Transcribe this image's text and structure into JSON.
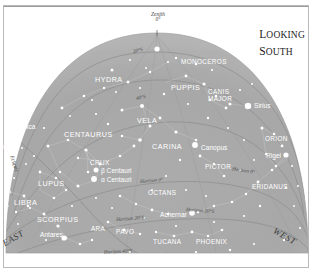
{
  "title": {
    "line1_cap": "L",
    "line1_rest": "OOKING",
    "line2_cap": "S",
    "line2_rest": "OUTH"
  },
  "zenith": {
    "label": "Zenith",
    "value": "0°"
  },
  "cardinals": {
    "east": "EAST",
    "west": "WEST"
  },
  "declination_arcs": [
    {
      "name": "dec-20s",
      "label": "20°S"
    },
    {
      "name": "dec-40s",
      "label": "40°S"
    }
  ],
  "horizon_lines": [
    {
      "name": "horizon-0",
      "label": "Horizon 0°"
    },
    {
      "name": "horizon-20s",
      "label": "Horizon 20°S"
    },
    {
      "name": "horizon-40s",
      "label": "Horizon 40°S"
    }
  ],
  "ecliptic": {
    "label": "Ecliptic"
  },
  "constellations": [
    {
      "name": "hydra",
      "label": "HYDRA",
      "x": 95,
      "y": 76,
      "size": "big"
    },
    {
      "name": "monoceros",
      "label": "MONOCEROS",
      "x": 181,
      "y": 59,
      "size": "con"
    },
    {
      "name": "puppis",
      "label": "PUPPIS",
      "x": 171,
      "y": 84,
      "size": "big"
    },
    {
      "name": "canis-major",
      "label": "CANIS",
      "x": 208,
      "y": 89,
      "size": "con"
    },
    {
      "name": "canis-major2",
      "label": "MAJOR",
      "x": 208,
      "y": 96,
      "size": "con"
    },
    {
      "name": "vela",
      "label": "VELA",
      "x": 137,
      "y": 117,
      "size": "big"
    },
    {
      "name": "centaurus",
      "label": "CENTAURUS",
      "x": 64,
      "y": 131,
      "size": "big"
    },
    {
      "name": "virgo",
      "label": "VIRGO",
      "x": -5,
      "y": 145,
      "size": "con"
    },
    {
      "name": "carina",
      "label": "CARINA",
      "x": 152,
      "y": 143,
      "size": "big"
    },
    {
      "name": "pictor",
      "label": "PICTOR",
      "x": 205,
      "y": 164,
      "size": "con"
    },
    {
      "name": "orion",
      "label": "ORION",
      "x": 265,
      "y": 136,
      "size": "con"
    },
    {
      "name": "eridanus",
      "label": "ERIDANUS",
      "x": 252,
      "y": 184,
      "size": "con"
    },
    {
      "name": "crux",
      "label": "CRUX",
      "x": 90,
      "y": 160,
      "size": "con"
    },
    {
      "name": "lupus",
      "label": "LUPUS",
      "x": 38,
      "y": 180,
      "size": "big"
    },
    {
      "name": "libra",
      "label": "LIBRA",
      "x": 14,
      "y": 199,
      "size": "big"
    },
    {
      "name": "octans",
      "label": "OCTANS",
      "x": 148,
      "y": 190,
      "size": "con"
    },
    {
      "name": "scorpius",
      "label": "SCORPIUS",
      "x": 37,
      "y": 216,
      "size": "big"
    },
    {
      "name": "ara",
      "label": "ARA",
      "x": 91,
      "y": 226,
      "size": "con"
    },
    {
      "name": "pavo",
      "label": "PAVO",
      "x": 116,
      "y": 229,
      "size": "con"
    },
    {
      "name": "tucana",
      "label": "TUCANA",
      "x": 153,
      "y": 239,
      "size": "con"
    },
    {
      "name": "phoenix",
      "label": "PHOENIX",
      "x": 196,
      "y": 239,
      "size": "con"
    }
  ],
  "named_stars": [
    {
      "name": "spica",
      "label": "Spica",
      "x": 19,
      "y": 124,
      "sx": 12,
      "sy": 133,
      "r": 2.6
    },
    {
      "name": "sirius",
      "label": "Sirius",
      "x": 254,
      "y": 103,
      "sx": 248,
      "sy": 106,
      "r": 3.2
    },
    {
      "name": "canopus",
      "label": "Canopus",
      "x": 201,
      "y": 145,
      "sx": 195,
      "sy": 145,
      "r": 2.9
    },
    {
      "name": "rigel",
      "label": "Rigel",
      "x": 266,
      "y": 153,
      "sx": 286,
      "sy": 155,
      "r": 2.6
    },
    {
      "name": "achernar",
      "label": "Achernar",
      "x": 160,
      "y": 212,
      "sx": 192,
      "sy": 213,
      "r": 2.8
    },
    {
      "name": "antares",
      "label": "Antares",
      "x": 40,
      "y": 232,
      "sx": 64,
      "sy": 238,
      "r": 2.6
    },
    {
      "name": "beta-centauri",
      "label": "β Centauri",
      "x": 101,
      "y": 168,
      "sx": 96,
      "sy": 170,
      "r": 2.5
    },
    {
      "name": "alpha-centauri",
      "label": "α Centauri",
      "x": 101,
      "y": 177,
      "sx": 94,
      "sy": 179,
      "r": 2.9
    }
  ],
  "colors": {
    "sky": "#a9a9a9",
    "sky_edge": "#bdbdbd",
    "paper": "#ffffff",
    "star": "#ffffff",
    "gridline": "#8a8a8a",
    "frame": "#b9b9b9",
    "text_dark": "#3a3a3a"
  },
  "chart_data": {
    "type": "scatter",
    "title": "LOOKING SOUTH",
    "projection": "horizon-dome",
    "center_label": "Zenith 0°",
    "axis_rings": [
      "20°S",
      "40°S"
    ],
    "horizon_rings": [
      "Horizon 0°",
      "Horizon 20°S",
      "Horizon 40°S"
    ],
    "left_cardinal": "EAST",
    "right_cardinal": "WEST",
    "constellation_count": 21,
    "named_star_count": 8
  }
}
